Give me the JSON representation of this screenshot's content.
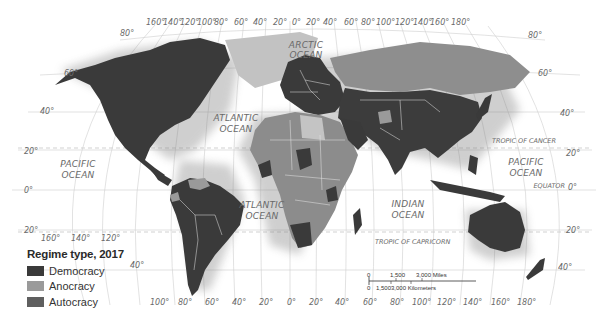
{
  "map": {
    "projection": "Robinson-like world projection",
    "colors": {
      "democracy": "#3a3a3a",
      "anocracy": "#9a9a9a",
      "autocracy": "#5f5f5f",
      "greenland": "#c2c2c2",
      "ocean": "#ffffff",
      "graticule": "#cfcfcf"
    },
    "ocean_labels": [
      {
        "id": "arctic",
        "lines": [
          "ARCTIC",
          "OCEAN"
        ]
      },
      {
        "id": "atlantic-north",
        "lines": [
          "ATLANTIC",
          "OCEAN"
        ]
      },
      {
        "id": "atlantic-south",
        "lines": [
          "ATLANTIC",
          "OCEAN"
        ]
      },
      {
        "id": "pacific-east",
        "lines": [
          "PACIFIC",
          "OCEAN"
        ]
      },
      {
        "id": "pacific-west",
        "lines": [
          "PACIFIC",
          "OCEAN"
        ]
      },
      {
        "id": "indian",
        "lines": [
          "INDIAN",
          "OCEAN"
        ]
      }
    ],
    "reference_lines": {
      "tropic_cancer": "TROPIC OF CANCER",
      "equator": "EQUATOR",
      "tropic_capricorn": "TROPIC OF CAPRICORN"
    },
    "top_longitudes": [
      "160°",
      "140°",
      "120°",
      "100°",
      "80°",
      "60°",
      "40°",
      "20°",
      "0°",
      "20°",
      "40°",
      "60°",
      "80°",
      "100°",
      "120°",
      "140°",
      "160°",
      "180°"
    ],
    "bottom_longitudes_left": [
      "160°",
      "140°",
      "120°"
    ],
    "bottom_longitudes": [
      "100°",
      "80°",
      "60°",
      "40°",
      "20°",
      "0°",
      "20°",
      "40°",
      "60°",
      "80°",
      "100°",
      "120°",
      "140°",
      "160°",
      "180°"
    ],
    "left_latitudes": [
      "80°",
      "60°",
      "40°",
      "20°",
      "0°",
      "20°",
      "40°"
    ],
    "right_latitudes": [
      "80°",
      "60°",
      "40°",
      "20°",
      "0°",
      "20°",
      "40°"
    ]
  },
  "legend": {
    "title": "Regime type, 2017",
    "items": [
      {
        "label": "Democracy",
        "color": "#3a3a3a"
      },
      {
        "label": "Anocracy",
        "color": "#9a9a9a"
      },
      {
        "label": "Autocracy",
        "color": "#5f5f5f"
      }
    ]
  },
  "scale": {
    "miles": {
      "ticks": [
        "0",
        "1,500",
        "3,000 Miles"
      ]
    },
    "kilometers": {
      "ticks": [
        "0",
        "1,500",
        "3,000 Kilometers"
      ]
    }
  }
}
